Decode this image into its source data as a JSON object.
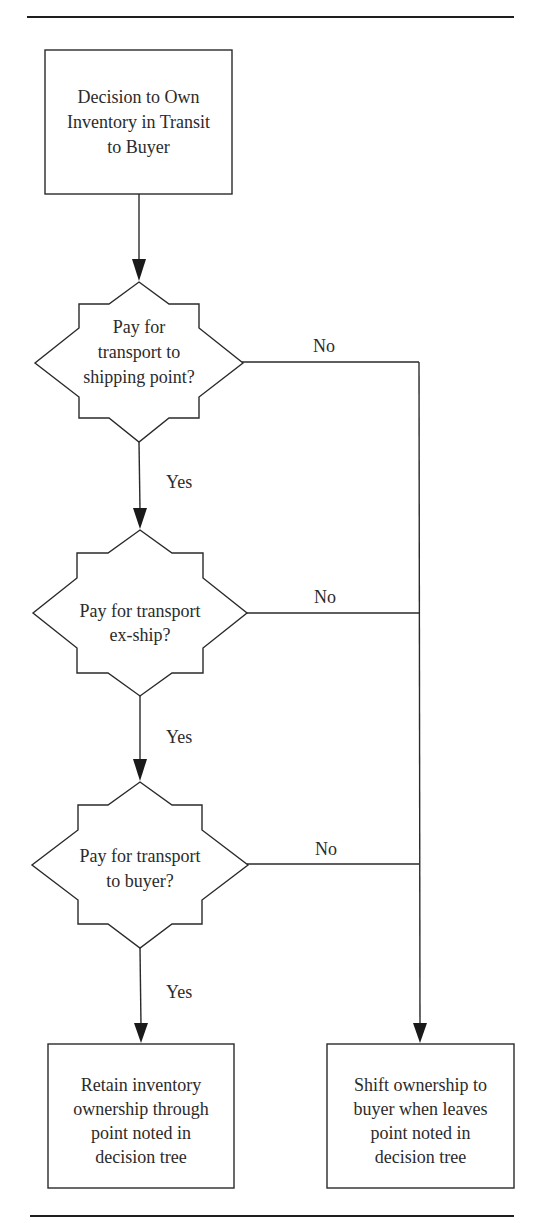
{
  "diagram": {
    "type": "flowchart",
    "start": {
      "id": "start",
      "lines": [
        "Decision to Own",
        "Inventory in Transit",
        "to Buyer"
      ]
    },
    "decisions": [
      {
        "id": "d1",
        "lines": [
          "Pay for",
          "transport to",
          "shipping point?"
        ],
        "yes_label": "Yes",
        "no_label": "No"
      },
      {
        "id": "d2",
        "lines": [
          "Pay for transport",
          "ex-ship?"
        ],
        "yes_label": "Yes",
        "no_label": "No"
      },
      {
        "id": "d3",
        "lines": [
          "Pay for transport",
          "to buyer?"
        ],
        "yes_label": "Yes",
        "no_label": "No"
      }
    ],
    "outcomes": {
      "yes": {
        "id": "retain",
        "lines": [
          "Retain inventory",
          "ownership through",
          "point noted in",
          "decision tree"
        ]
      },
      "no": {
        "id": "shift",
        "lines": [
          "Shift ownership to",
          "buyer when leaves",
          "point noted in",
          "decision tree"
        ]
      }
    },
    "edges": [
      {
        "from": "start",
        "to": "d1",
        "label": ""
      },
      {
        "from": "d1",
        "to": "d2",
        "label": "Yes"
      },
      {
        "from": "d1",
        "to": "shift",
        "label": "No"
      },
      {
        "from": "d2",
        "to": "d3",
        "label": "Yes"
      },
      {
        "from": "d2",
        "to": "shift",
        "label": "No"
      },
      {
        "from": "d3",
        "to": "retain",
        "label": "Yes"
      },
      {
        "from": "d3",
        "to": "shift",
        "label": "No"
      }
    ]
  },
  "colors": {
    "ink": "#2a2a2a",
    "background": "#ffffff"
  }
}
